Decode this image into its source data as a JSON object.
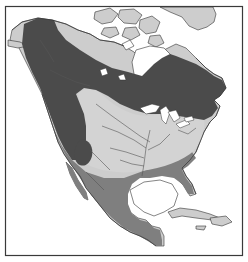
{
  "map": {
    "subject": "North America range map",
    "frame": {
      "x": 5,
      "y": 6,
      "width": 238,
      "height": 250
    },
    "colors": {
      "water": "#ffffff",
      "land_outside_range": "#cdcdcd",
      "zone_dark": "#4b4b4b",
      "zone_medium": "#7f7f7f",
      "zone_light": "#cfcfcf",
      "outline": "#333333",
      "rivers": "#555555",
      "frame": "#3a3a3a"
    },
    "zones": [
      {
        "id": "dark",
        "description": "dark gray band: Alaska interior, western Canada, Pacific Northwest, Rocky Mountains, boreal Canada east to Newfoundland"
      },
      {
        "id": "medium",
        "description": "medium gray: Pacific coast California, southern US border, Florida, Mexico, Central America"
      },
      {
        "id": "light",
        "description": "light gray oval: central and eastern United States interior"
      }
    ],
    "legend": null,
    "labels": []
  }
}
